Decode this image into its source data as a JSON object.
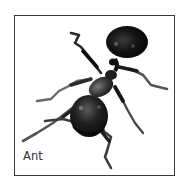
{
  "card": {
    "label": "Ant",
    "image_subject": "ant-illustration",
    "border_color": "#3a3a3a",
    "background_color": "#ffffff",
    "label_color": "#333333"
  }
}
